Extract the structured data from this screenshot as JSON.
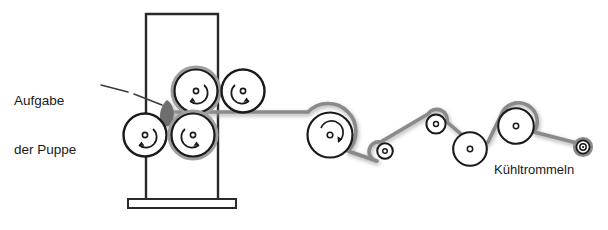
{
  "figure": {
    "kind": "technical-line-diagram",
    "background_color": "#ffffff",
    "ink_color": "#1a1a1a",
    "web_color": "#8a8a8a",
    "web_shadow_color": "#bdbdbd",
    "puppe_color": "#6e6e6e",
    "frame_color": "#2a2a2a"
  },
  "labels": {
    "feed": {
      "line1": "Aufgabe",
      "line2": "der Puppe",
      "leader": "dashed-leader-line",
      "points_to": "nip-blob"
    },
    "cooling": {
      "text": "Kühltrommeln"
    }
  },
  "machine": {
    "frame": {
      "name": "calender-frame",
      "left_post_x": 146,
      "right_post_x": 218,
      "top_y": 13,
      "bottom_y": 199,
      "base_plate": {
        "x": 128,
        "y": 199,
        "width": 108,
        "height": 9
      }
    },
    "calender_rollers": [
      {
        "id": "upper-left",
        "cx": 196,
        "cy": 91,
        "r": 22,
        "rotation": "counter-clockwise",
        "hub": true,
        "jacket": true
      },
      {
        "id": "upper-right",
        "cx": 243,
        "cy": 91,
        "r": 22,
        "rotation": "clockwise",
        "hub": true,
        "jacket": false
      },
      {
        "id": "lower-left",
        "cx": 145,
        "cy": 135,
        "r": 22,
        "rotation": "counter-clockwise",
        "hub": true,
        "jacket": false
      },
      {
        "id": "lower-right",
        "cx": 193,
        "cy": 135,
        "r": 22,
        "rotation": "clockwise",
        "hub": true,
        "jacket": true
      }
    ],
    "nip_blob": {
      "cx": 167,
      "cy": 113,
      "rx": 8,
      "ry": 13,
      "label": "Puppe"
    }
  },
  "cooling_drums": [
    {
      "id": "drum-1",
      "cx": 330,
      "cy": 135,
      "r": 23,
      "rotation": "clockwise",
      "hub": true
    },
    {
      "id": "roller-2",
      "cx": 385,
      "cy": 151,
      "r": 8,
      "rotation": "none",
      "hub": true
    },
    {
      "id": "roller-3",
      "cx": 436,
      "cy": 124,
      "r": 10,
      "rotation": "none",
      "hub": true
    },
    {
      "id": "drum-4",
      "cx": 470,
      "cy": 149,
      "r": 17,
      "rotation": "none",
      "hub": true
    },
    {
      "id": "drum-5",
      "cx": 516,
      "cy": 126,
      "r": 18,
      "rotation": "none",
      "hub": true
    },
    {
      "id": "roller-6",
      "cx": 583,
      "cy": 147,
      "r": 8,
      "rotation": "none",
      "hub": true,
      "double_ring": true
    }
  ],
  "web_path": {
    "name": "material-web",
    "description": "grey web leaving the calender nip and running in a zigzag over the cooling drums",
    "points": "M 167,113 L 262,113 L 307,113 A 23 23 0 0 1 347,150 L 377,160 A 8 8 0 0 1 381,143 L 428,115 A 10 10 0 0 1 446,122 L 461,133 A 17 17 0 0 0 487,142 L 504,112 A 18 18 0 0 1 533,132 L 576,142"
  },
  "web_segments": [
    {
      "from": "nip",
      "to": "drum-1",
      "shape": "horizontal"
    },
    {
      "from": "drum-1",
      "to": "roller-2",
      "shape": "descending"
    },
    {
      "from": "roller-2",
      "to": "roller-3",
      "shape": "ascending"
    },
    {
      "from": "roller-3",
      "to": "drum-4",
      "shape": "descending"
    },
    {
      "from": "drum-4",
      "to": "drum-5",
      "shape": "ascending"
    },
    {
      "from": "drum-5",
      "to": "roller-6",
      "shape": "descending"
    }
  ]
}
